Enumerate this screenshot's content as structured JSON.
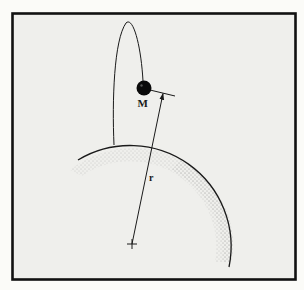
{
  "figure": {
    "labels": {
      "mass": "M",
      "radius": "r"
    },
    "colors": {
      "background": "#fbfbf8",
      "panel": "#efefec",
      "frame": "#111111",
      "ink": "#1a1a1a",
      "mass_fill": "#0a0a0a",
      "stipple": "#8a8a8a"
    },
    "elements": {
      "planet": "partial circle (arc) with stippled shading near its right rim",
      "orbit": "narrow elongated ellipse",
      "mass": "solid black sphere",
      "radius_vector": "line from planet center to mass with arrowhead",
      "center_marker": "cross at planet center"
    }
  }
}
